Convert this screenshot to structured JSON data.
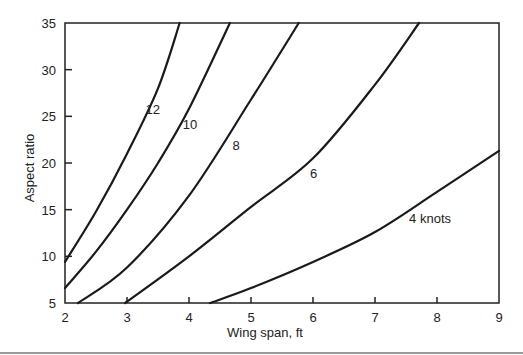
{
  "chart_data": {
    "type": "line",
    "title": "",
    "xlabel": "Wing span, ft",
    "ylabel": "Aspect ratio",
    "xlim": [
      2,
      9
    ],
    "ylim": [
      5,
      35
    ],
    "xticks": [
      2,
      3,
      4,
      5,
      6,
      7,
      8,
      9
    ],
    "yticks": [
      5,
      10,
      15,
      20,
      25,
      30,
      35
    ],
    "grid": false,
    "legend": "inline curve labels",
    "series": [
      {
        "name": "12",
        "label": "12",
        "label_at": [
          3.3,
          25.3
        ],
        "x": [
          2.0,
          2.5,
          3.0,
          3.5,
          3.85
        ],
        "y": [
          9.4,
          14.8,
          21.0,
          28.0,
          35.0
        ]
      },
      {
        "name": "10",
        "label": "10",
        "label_at": [
          3.9,
          23.6
        ],
        "x": [
          2.0,
          2.5,
          3.0,
          3.5,
          4.0,
          4.66
        ],
        "y": [
          6.6,
          10.5,
          15.0,
          20.0,
          25.8,
          35.0
        ]
      },
      {
        "name": "8",
        "label": "8",
        "label_at": [
          4.7,
          21.4
        ],
        "x": [
          2.21,
          3.0,
          4.0,
          5.0,
          5.77
        ],
        "y": [
          5.0,
          8.8,
          16.5,
          26.8,
          35.0
        ]
      },
      {
        "name": "6",
        "label": "6",
        "label_at": [
          5.95,
          18.4
        ],
        "x": [
          2.97,
          4.0,
          5.0,
          6.0,
          7.0,
          7.71
        ],
        "y": [
          5.0,
          10.0,
          15.3,
          20.5,
          28.4,
          35.0
        ]
      },
      {
        "name": "4 knots",
        "label": "4 knots",
        "label_at": [
          7.55,
          13.6
        ],
        "x": [
          4.34,
          5.0,
          6.0,
          7.0,
          8.0,
          9.0
        ],
        "y": [
          5.0,
          6.6,
          9.4,
          12.6,
          16.9,
          21.3
        ]
      }
    ]
  }
}
